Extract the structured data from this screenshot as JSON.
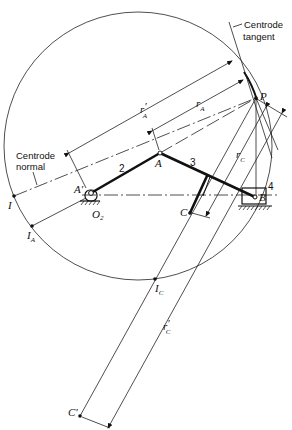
{
  "figure": {
    "annotations": {
      "centrode_tangent": [
        "Centrode",
        "tangent"
      ],
      "centrode_normal": [
        "Centrode",
        "normal"
      ]
    },
    "points": {
      "P": "P",
      "A": "A",
      "A_prime": "A'",
      "O2": {
        "main": "O",
        "sub": "2"
      },
      "B": "B",
      "C": "C",
      "C_prime": "C'",
      "I": "I",
      "I_A": {
        "main": "I",
        "sub": "A"
      },
      "I_C": {
        "main": "I",
        "sub": "C"
      }
    },
    "links": {
      "link2": "2",
      "link3": "3",
      "link4": "4"
    },
    "dimensions": {
      "r_A_prime": {
        "main": "r",
        "sub": "A",
        "prime": "′"
      },
      "r_A": {
        "main": "r",
        "sub": "A"
      },
      "r_C": {
        "main": "r",
        "sub": "C"
      },
      "r_C_prime": {
        "main": "r",
        "sub": "C",
        "prime": "′"
      }
    }
  }
}
